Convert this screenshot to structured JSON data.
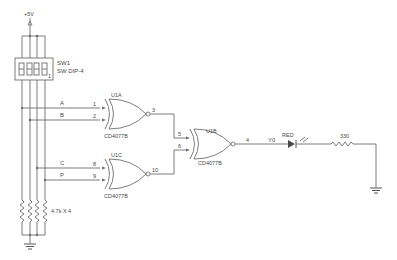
{
  "schematic": {
    "power": {
      "label": "+5V"
    },
    "switch": {
      "ref": "SW1",
      "value": "SW DIP-4",
      "pin_mark": "1"
    },
    "pullups": {
      "label": "4.7k X 4"
    },
    "signals": {
      "a": "A",
      "b": "B",
      "c": "C",
      "p": "P",
      "y0": "Y0"
    },
    "gates": [
      {
        "ref": "U1A",
        "part": "CD4077B",
        "in1": "1",
        "in2": "2",
        "out": "3"
      },
      {
        "ref": "U1C",
        "part": "CD4077B",
        "in1": "8",
        "in2": "9",
        "out": "10"
      },
      {
        "ref": "U1B",
        "part": "CD4077B",
        "in1": "5",
        "in2": "6",
        "out": "4"
      }
    ],
    "led": {
      "label": "RED"
    },
    "resistor": {
      "value": "330"
    }
  },
  "colors": {
    "wire": "#6e6e6e",
    "background": "#ffffff",
    "text": "#4a4a4a"
  }
}
